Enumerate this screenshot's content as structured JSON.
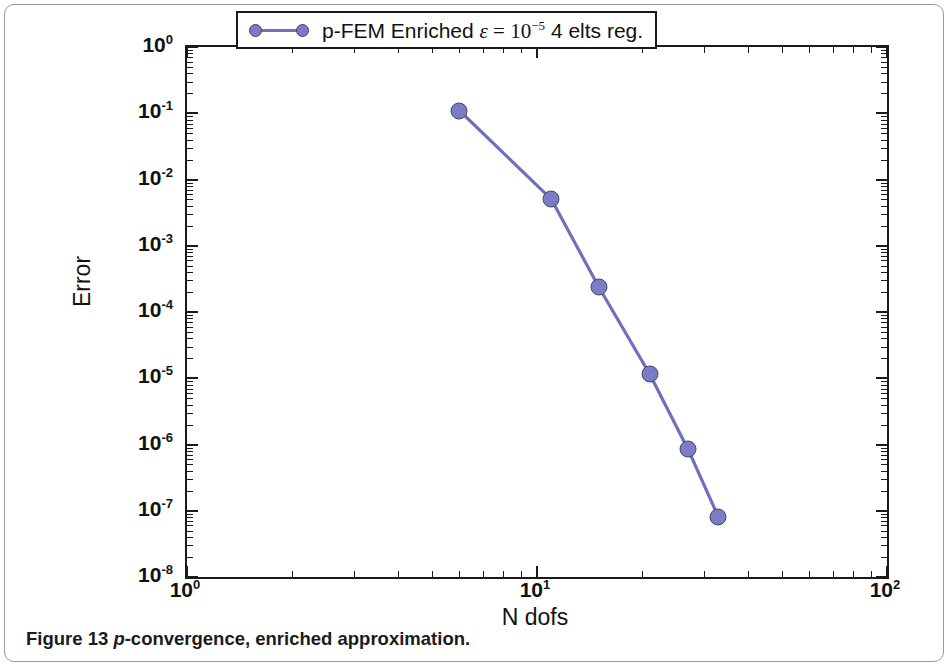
{
  "caption": {
    "prefix": "Figure 13 ",
    "italic": "p",
    "suffix": "-convergence, enriched approximation."
  },
  "legend": {
    "text_before_eps": "p-FEM Enriched ",
    "eps_symbol": "ε",
    "equals": " = ",
    "power_base": "10",
    "power_exp": "−5",
    "text_after": " 4 elts reg."
  },
  "colors": {
    "marker_fill": "#7b7bc6",
    "marker_edge": "#45456f",
    "line": "#6f6fbe",
    "axis": "#1a1a1a",
    "text": "#111111",
    "frame": "#9a9a9a"
  },
  "chart_data": {
    "type": "line",
    "title": "",
    "xlabel": "N dofs",
    "ylabel": "Error",
    "xscale": "log",
    "yscale": "log",
    "xlim": [
      1,
      100
    ],
    "ylim": [
      1e-08,
      1
    ],
    "grid": false,
    "legend_position": "top-center",
    "xticks": [
      1,
      10,
      100
    ],
    "xticklabels": [
      "10⁰",
      "10¹",
      "10²"
    ],
    "yticks": [
      1,
      0.1,
      0.01,
      0.001,
      0.0001,
      1e-05,
      1e-06,
      1e-07,
      1e-08
    ],
    "yticklabels": [
      "10⁰",
      "10⁻¹",
      "10⁻²",
      "10⁻³",
      "10⁻⁴",
      "10⁻⁵",
      "10⁻⁶",
      "10⁻⁷",
      "10⁻⁸"
    ],
    "series": [
      {
        "name": "p-FEM Enriched ε = 10⁻⁵ 4 elts reg.",
        "x": [
          6,
          11,
          15,
          21,
          27,
          33
        ],
        "y": [
          0.11,
          0.005,
          0.00024,
          1.15e-05,
          8.5e-07,
          8e-08
        ],
        "color": "#7b7bc6",
        "marker": "circle"
      }
    ]
  }
}
